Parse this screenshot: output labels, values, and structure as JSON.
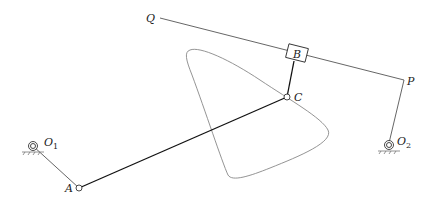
{
  "diagram": {
    "type": "four-bar linkage with coupler curve",
    "labels": {
      "Q": "Q",
      "B": "B",
      "P": "P",
      "C": "C",
      "A": "A",
      "O1_main": "O",
      "O1_sub": "1",
      "O2_main": "O",
      "O2_sub": "2"
    },
    "links": [
      {
        "name": "crank-O1-A",
        "from": "O1",
        "to": "A"
      },
      {
        "name": "coupler-A-C",
        "from": "A",
        "to": "C"
      },
      {
        "name": "link-C-B",
        "from": "C",
        "to": "B"
      },
      {
        "name": "slider-rod-Q-P",
        "from": "Q",
        "to": "P"
      },
      {
        "name": "rocker-P-O2",
        "from": "P",
        "to": "O2"
      }
    ],
    "fixed_pivots": [
      "O1",
      "O2"
    ],
    "slider": "B"
  }
}
